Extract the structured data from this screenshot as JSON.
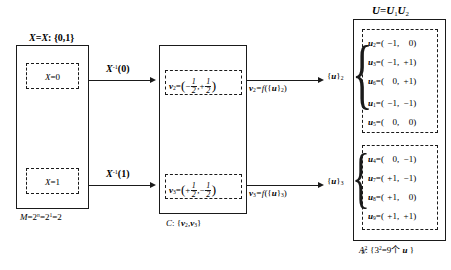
{
  "diagram": {
    "title_u": "U=U₁U₂",
    "left_box": {
      "top_label_parts": {
        "x1": "X",
        "eq": "=",
        "x2": "X",
        "colon": ": {0,1}"
      },
      "top_label": "X=X:{0,1}",
      "inner_top": "X=0",
      "inner_bottom": "X=1",
      "bottom_label": "M=2ⁿ=2¹=2"
    },
    "arrows_left": [
      {
        "label": "X⁻¹(0)",
        "base": "X",
        "sup": "-1",
        "arg": "(0)"
      },
      {
        "label": "X⁻¹(1)",
        "base": "X",
        "sup": "-1",
        "arg": "(1)"
      }
    ],
    "middle_box": {
      "vec_top": {
        "name": "v",
        "sub": "2",
        "eq": "=",
        "x_sign": "−",
        "x_num": "1",
        "x_den": "2",
        "sep": ",",
        "y_sign": "+",
        "y_num": "1",
        "y_den": "2"
      },
      "vec_bottom": {
        "name": "v",
        "sub": "3",
        "eq": "=",
        "x_sign": "+",
        "x_num": "1",
        "x_den": "2",
        "sep": ",",
        "y_sign": "−",
        "y_num": "1",
        "y_den": "2"
      },
      "bottom_label": "C:{v₂,v₃}",
      "bottom_label_parts": {
        "c": "C",
        "colon": ": {",
        "v1": "v",
        "s1": "2",
        "comma": ",",
        "v2": "v",
        "s2": "3",
        "close": "}"
      }
    },
    "arrows_right": [
      {
        "label": "v₂=f({u}₂)",
        "v": "v",
        "vsub": "2",
        "eq": "=f({",
        "u": "u",
        "close": "}",
        "usub": "2",
        "paren": ")",
        "target": "{u}₂",
        "target_u": "u",
        "target_sub": "2"
      },
      {
        "label": "v₃=f({u}₃)",
        "v": "v",
        "vsub": "3",
        "eq": "=f({",
        "u": "u",
        "close": "}",
        "usub": "3",
        "paren": ")",
        "target": "{u}₃",
        "target_u": "u",
        "target_sub": "3"
      }
    ],
    "right_box": {
      "group_top": {
        "set_label": "{u}₂",
        "items": [
          {
            "name": "u",
            "sub": "2",
            "x": "−1",
            "y": "0"
          },
          {
            "name": "u",
            "sub": "3",
            "x": "−1",
            "y": "+1"
          },
          {
            "name": "u",
            "sub": "6",
            "x": "0",
            "y": "+1"
          },
          {
            "name": "u",
            "sub": "1",
            "x": "−1",
            "y": "−1"
          },
          {
            "name": "u",
            "sub": "5",
            "x": "0",
            "y": "0"
          }
        ]
      },
      "group_bottom": {
        "set_label": "{u}₃",
        "items": [
          {
            "name": "u",
            "sub": "4",
            "x": "0",
            "y": "−1"
          },
          {
            "name": "u",
            "sub": "7",
            "x": "+1",
            "y": "−1"
          },
          {
            "name": "u",
            "sub": "8",
            "x": "+1",
            "y": "0"
          },
          {
            "name": "u",
            "sub": "9",
            "x": "+1",
            "y": "+1"
          }
        ]
      },
      "bottom_label": "A²U:{3²=9个 u}",
      "bottom_parts": {
        "a": "A",
        "sup": "2",
        "sub": "U",
        "colon": ": {",
        "three": "3",
        "exp": "2",
        "eq": "=9",
        "ge": "个",
        "u": "u",
        "close": "}"
      }
    },
    "colors": {
      "ink": "#1a1a1a",
      "background": "#ffffff"
    }
  }
}
